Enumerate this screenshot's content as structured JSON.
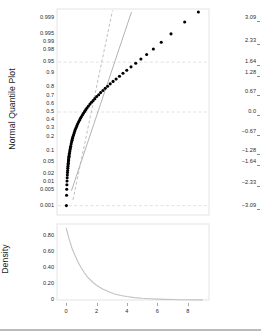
{
  "figure": {
    "background": "#ffffff",
    "point_color": "#000000",
    "reference_line_color": "#9a9a9a",
    "dashed_line_color": "#b4b4b4",
    "grid_color": "#cfcfcf",
    "frame_color": "#d8d8d8",
    "axis_text_color": "#2a2a2a"
  },
  "chart_data": [
    {
      "type": "scatter",
      "id": "normal-quantile-plot",
      "title": "",
      "ylabel": "Normal Quantile Plot",
      "xlabel": "",
      "xlim": [
        -0.6,
        9.4
      ],
      "ylim": [
        -3.4,
        3.4
      ],
      "grid": true,
      "legend": null,
      "xticks": [
        0,
        2,
        4,
        6,
        8
      ],
      "xticklabels": [
        "0",
        "2",
        "4",
        "6",
        "8"
      ],
      "yticks_probability": [
        0.999,
        0.995,
        0.99,
        0.98,
        0.95,
        0.9,
        0.8,
        0.7,
        0.6,
        0.5,
        0.4,
        0.3,
        0.2,
        0.1,
        0.05,
        0.02,
        0.01,
        0.005,
        0.001
      ],
      "yticklabels_probability": [
        "0.999",
        "0.995",
        "0.99",
        "0.98",
        "0.95",
        "0.9",
        "0.8",
        "0.7",
        "0.6",
        "0.5",
        "0.4",
        "0.3",
        "0.2",
        "0.1",
        "0.05",
        "0.02",
        "0.01",
        "0.005",
        "0.001"
      ],
      "yticks_zscore": [
        3.09,
        2.33,
        1.64,
        1.28,
        0.67,
        0.0,
        -0.67,
        -1.28,
        -1.64,
        -2.33,
        -3.09
      ],
      "yticklabels_zscore": [
        "3.09",
        "2.33",
        "1.64",
        "1.28",
        "0.67",
        "0.0",
        "-0.67",
        "-1.28",
        "-1.64",
        "-2.33",
        "-3.09"
      ],
      "notes": "Right-skewed sample plotted against normal quantiles; points bow below the straight normal reference line indicating non-normality.",
      "points": [
        [
          0.02,
          -3.09
        ],
        [
          0.03,
          -2.75
        ],
        [
          0.04,
          -2.55
        ],
        [
          0.05,
          -2.4
        ],
        [
          0.06,
          -2.28
        ],
        [
          0.07,
          -2.17
        ],
        [
          0.08,
          -2.08
        ],
        [
          0.09,
          -2.0
        ],
        [
          0.1,
          -1.93
        ],
        [
          0.11,
          -1.86
        ],
        [
          0.12,
          -1.8
        ],
        [
          0.13,
          -1.74
        ],
        [
          0.14,
          -1.69
        ],
        [
          0.15,
          -1.64
        ],
        [
          0.16,
          -1.59
        ],
        [
          0.17,
          -1.55
        ],
        [
          0.18,
          -1.5
        ],
        [
          0.19,
          -1.46
        ],
        [
          0.2,
          -1.42
        ],
        [
          0.22,
          -1.36
        ],
        [
          0.24,
          -1.3
        ],
        [
          0.26,
          -1.24
        ],
        [
          0.28,
          -1.18
        ],
        [
          0.3,
          -1.13
        ],
        [
          0.33,
          -1.06
        ],
        [
          0.36,
          -0.99
        ],
        [
          0.39,
          -0.93
        ],
        [
          0.42,
          -0.87
        ],
        [
          0.45,
          -0.81
        ],
        [
          0.49,
          -0.75
        ],
        [
          0.53,
          -0.69
        ],
        [
          0.57,
          -0.63
        ],
        [
          0.61,
          -0.57
        ],
        [
          0.66,
          -0.51
        ],
        [
          0.71,
          -0.45
        ],
        [
          0.76,
          -0.39
        ],
        [
          0.82,
          -0.33
        ],
        [
          0.88,
          -0.27
        ],
        [
          0.94,
          -0.21
        ],
        [
          1.0,
          -0.16
        ],
        [
          1.07,
          -0.1
        ],
        [
          1.14,
          -0.04
        ],
        [
          1.22,
          0.02
        ],
        [
          1.3,
          0.08
        ],
        [
          1.38,
          0.14
        ],
        [
          1.47,
          0.2
        ],
        [
          1.57,
          0.26
        ],
        [
          1.67,
          0.32
        ],
        [
          1.78,
          0.38
        ],
        [
          1.89,
          0.44
        ],
        [
          2.01,
          0.51
        ],
        [
          2.14,
          0.57
        ],
        [
          2.27,
          0.64
        ],
        [
          2.42,
          0.71
        ],
        [
          2.57,
          0.78
        ],
        [
          2.73,
          0.85
        ],
        [
          2.9,
          0.93
        ],
        [
          3.09,
          1.01
        ],
        [
          3.29,
          1.09
        ],
        [
          3.51,
          1.18
        ],
        [
          3.74,
          1.28
        ],
        [
          3.99,
          1.38
        ],
        [
          4.27,
          1.49
        ],
        [
          4.58,
          1.61
        ],
        [
          4.92,
          1.75
        ],
        [
          5.3,
          1.9
        ],
        [
          5.74,
          2.08
        ],
        [
          6.26,
          2.3
        ],
        [
          6.9,
          2.58
        ],
        [
          7.8,
          2.97
        ],
        [
          8.7,
          3.3
        ]
      ],
      "reference_lines": [
        {
          "name": "normal-fit-line",
          "style": "solid",
          "slope_note": "straight normal reference through the data center"
        },
        {
          "name": "steep-dashed-line",
          "style": "dashed",
          "slope_note": "steeper dashed comparison line"
        },
        {
          "name": "p95-gridline",
          "style": "dashed",
          "orientation": "horizontal",
          "at": 0.95
        },
        {
          "name": "p50-gridline",
          "style": "dashed",
          "orientation": "horizontal",
          "at": 0.5
        },
        {
          "name": "p001-gridline",
          "style": "dashed",
          "orientation": "horizontal",
          "at": 0.001
        }
      ]
    },
    {
      "type": "line",
      "id": "density-plot",
      "title": "",
      "ylabel": "Density",
      "xlabel": "",
      "xlim": [
        -0.6,
        9.4
      ],
      "ylim": [
        0,
        0.95
      ],
      "grid": false,
      "legend": null,
      "xticks": [
        0,
        2,
        4,
        6,
        8
      ],
      "xticklabels": [
        "0",
        "2",
        "4",
        "6",
        "8"
      ],
      "yticks": [
        0,
        0.2,
        0.4,
        0.6,
        0.8
      ],
      "yticklabels": [
        "0",
        "0.20",
        "0.40",
        "0.60",
        "0.80"
      ],
      "notes": "Smooth exponential-like decay density of the same right-skewed sample.",
      "x": [
        0.0,
        0.2,
        0.4,
        0.6,
        0.8,
        1.0,
        1.2,
        1.4,
        1.6,
        1.8,
        2.0,
        2.4,
        2.8,
        3.2,
        3.6,
        4.0,
        4.5,
        5.0,
        5.5,
        6.0,
        6.5,
        7.0,
        7.5,
        8.0,
        8.5,
        9.0
      ],
      "y": [
        0.9,
        0.76,
        0.64,
        0.55,
        0.47,
        0.4,
        0.34,
        0.29,
        0.25,
        0.215,
        0.185,
        0.138,
        0.102,
        0.076,
        0.057,
        0.043,
        0.03,
        0.021,
        0.015,
        0.011,
        0.008,
        0.006,
        0.004,
        0.003,
        0.002,
        0.002
      ]
    }
  ]
}
